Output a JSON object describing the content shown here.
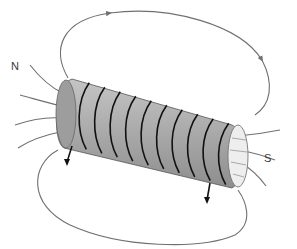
{
  "diagram": {
    "labels": {
      "north": "N",
      "south": "S"
    },
    "coil_turns": 10,
    "colors": {
      "coil_body": "#a8a8a8",
      "coil_wire": "#111111",
      "field_lines": "#707070",
      "label_text": "#3a3a3a",
      "background": "#ffffff"
    },
    "icons": {
      "field_arrow": "arrowhead-icon",
      "lead_wire": "wire-lead-icon"
    }
  }
}
